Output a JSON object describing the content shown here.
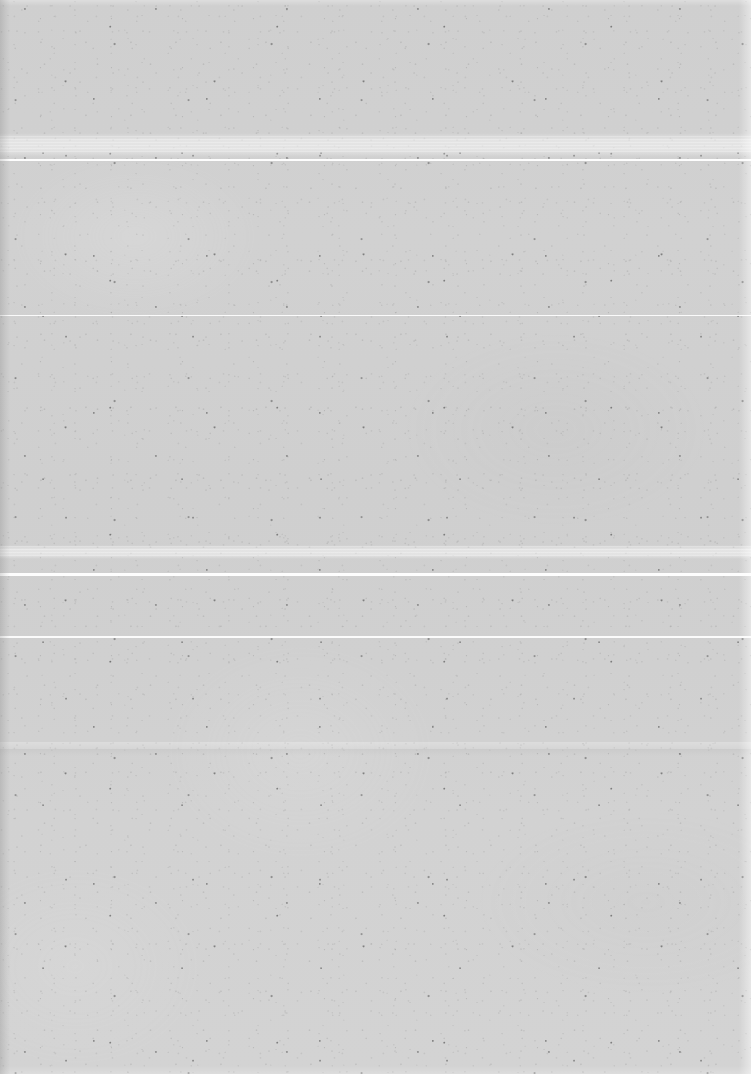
{
  "document": {
    "kind": "scanned-page",
    "orientation": "portrait",
    "width_px": 751,
    "height_px": 1074,
    "visible_text": "",
    "has_text": false,
    "has_figures": false,
    "description": "Blank scanned paper page with fibre speckle and horizontal scanner artefact lines"
  },
  "colors": {
    "paper_base": "#d0d0d0",
    "paper_top": "#cfcfcf",
    "paper_bottom": "#d3d3d3",
    "scan_line": "#fdfdfd",
    "speck_dark": "#2b2b2b",
    "edge_left_shadow": "#787878",
    "edge_right_highlight": "#ffffff"
  },
  "artifacts": {
    "scan_lines": [
      {
        "name": "scan-line-1",
        "y": 159,
        "height": 2,
        "opacity": 1.0
      },
      {
        "name": "scan-line-2",
        "y": 315,
        "height": 1,
        "opacity": 0.92
      },
      {
        "name": "scan-line-3",
        "y": 573,
        "height": 3,
        "opacity": 1.0
      },
      {
        "name": "scan-line-4",
        "y": 636,
        "height": 2,
        "opacity": 0.96
      }
    ],
    "bright_bands": [
      {
        "name": "bright-band-upper",
        "y": 133,
        "height": 24
      },
      {
        "name": "bright-band-middle",
        "y": 545,
        "height": 14
      }
    ],
    "striation_bands": [
      {
        "name": "striation-band-upper",
        "y": 136,
        "height": 18
      },
      {
        "name": "striation-band-middle",
        "y": 546,
        "height": 12
      }
    ],
    "tonal_seams": [
      {
        "name": "tonal-seam-lower",
        "y": 742,
        "height": 14
      }
    ]
  },
  "edges": {
    "left": {
      "name": "edge-left-shadow",
      "width": 10
    },
    "right": {
      "name": "edge-right-highlight",
      "width": 12
    },
    "top": {
      "name": "edge-top-highlight",
      "height": 6
    },
    "bottom": {
      "name": "edge-bottom-highlight",
      "height": 8
    }
  }
}
